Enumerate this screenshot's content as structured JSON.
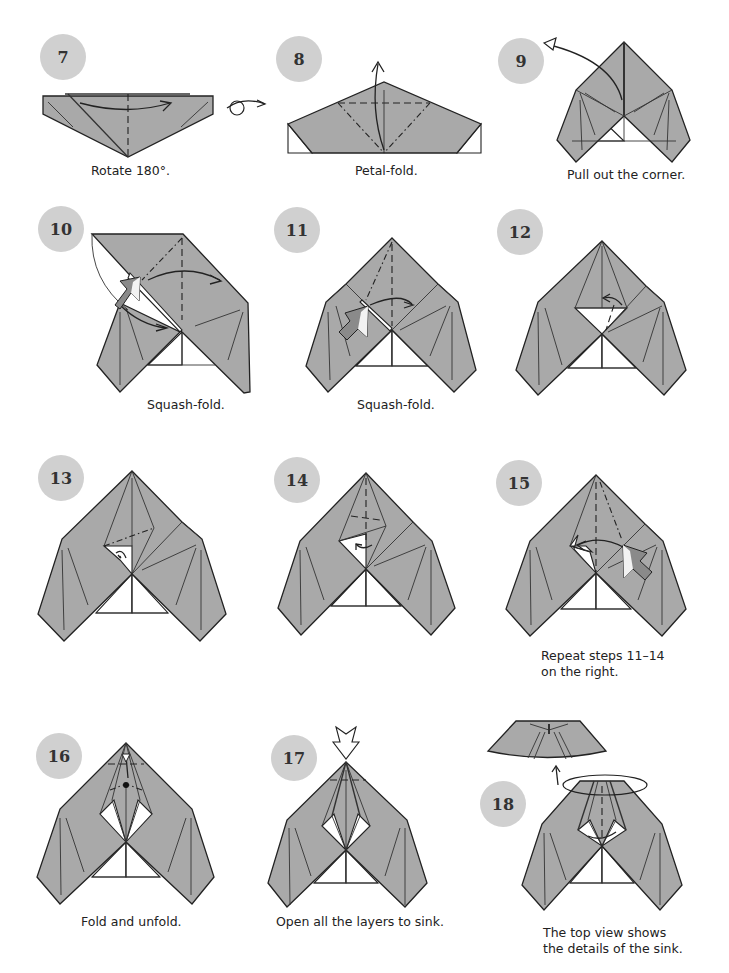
{
  "page": {
    "colors": {
      "badge": "#d0d0d0",
      "paper": "#a9a9a9",
      "line": "#222222",
      "background": "#ffffff"
    }
  },
  "steps": [
    {
      "number": "7",
      "caption": "Rotate 180°.",
      "symbols": [
        "turn-over-arrow",
        "valley-fold"
      ]
    },
    {
      "number": "8",
      "caption": "Petal-fold.",
      "symbols": [
        "valley-fold",
        "mountain-fold",
        "fold-arrow"
      ]
    },
    {
      "number": "9",
      "caption": "Pull out the corner.",
      "symbols": [
        "pull-arrow"
      ]
    },
    {
      "number": "10",
      "caption": "Squash-fold.",
      "symbols": [
        "push-arrow",
        "valley-fold",
        "mountain-fold"
      ]
    },
    {
      "number": "11",
      "caption": "Squash-fold.",
      "symbols": [
        "push-arrow",
        "valley-fold",
        "mountain-fold"
      ]
    },
    {
      "number": "12",
      "caption": "",
      "symbols": [
        "fold-arrow"
      ]
    },
    {
      "number": "13",
      "caption": "",
      "symbols": [
        "mountain-fold",
        "fold-arrow"
      ]
    },
    {
      "number": "14",
      "caption": "",
      "symbols": [
        "valley-fold",
        "fold-arrow"
      ]
    },
    {
      "number": "15",
      "caption_lines": [
        "Repeat steps 11–14",
        "on the right."
      ],
      "symbols": [
        "push-arrow",
        "valley-fold",
        "mountain-fold"
      ]
    },
    {
      "number": "16",
      "caption": "Fold and unfold.",
      "symbols": [
        "valley-fold",
        "reference-dot"
      ]
    },
    {
      "number": "17",
      "caption": "Open all the layers to sink.",
      "symbols": [
        "sink-arrow",
        "valley-fold"
      ]
    },
    {
      "number": "18",
      "caption_lines": [
        "The top view shows",
        "the details of the sink."
      ],
      "symbols": [
        "view-ellipse",
        "view-arrow"
      ]
    }
  ]
}
